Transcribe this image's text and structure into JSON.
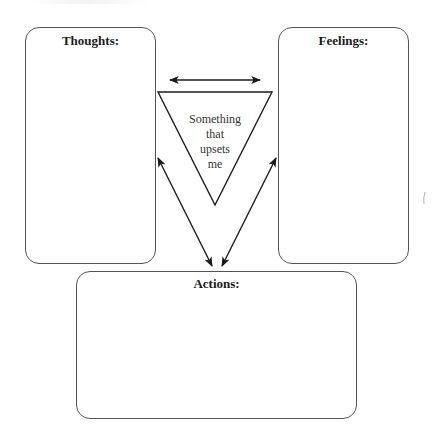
{
  "diagram": {
    "boxes": {
      "thoughts": {
        "title": "Thoughts:"
      },
      "feelings": {
        "title": "Feelings:"
      },
      "actions": {
        "title": "Actions:"
      }
    },
    "center": {
      "lines": [
        "Something",
        "that",
        "upsets",
        "me"
      ]
    },
    "arrows": [
      {
        "from": "thoughts",
        "to": "feelings",
        "type": "double"
      },
      {
        "from": "thoughts",
        "to": "actions",
        "type": "double"
      },
      {
        "from": "feelings",
        "to": "actions",
        "type": "double"
      }
    ],
    "colors": {
      "stroke": "#1a1a1a",
      "box_border": "#555555",
      "background": "#ffffff"
    }
  }
}
